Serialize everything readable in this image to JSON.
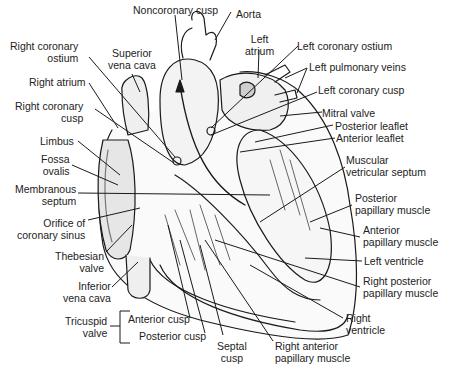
{
  "diagram": {
    "labels_left": [
      {
        "id": "right-coronary-ostium",
        "text": "Right coronary\nostium"
      },
      {
        "id": "superior-vena-cava",
        "text": "Superior\nvena cava"
      },
      {
        "id": "right-atrium",
        "text": "Right atrium"
      },
      {
        "id": "right-coronary-cusp",
        "text": "Right coronary\ncusp"
      },
      {
        "id": "limbus",
        "text": "Limbus"
      },
      {
        "id": "fossa-ovalis",
        "text": "Fossa\novalis"
      },
      {
        "id": "membranous-septum",
        "text": "Membranous\nseptum"
      },
      {
        "id": "orifice-coronary-sinus",
        "text": "Orifice of\ncoronary sinus"
      },
      {
        "id": "thebesian-valve",
        "text": "Thebesian\nvalve"
      },
      {
        "id": "inferior-vena-cava",
        "text": "Inferior\nvena cava"
      }
    ],
    "labels_top": [
      {
        "id": "noncoronary-cusp",
        "text": "Noncoronary cusp"
      },
      {
        "id": "aorta",
        "text": "Aorta"
      },
      {
        "id": "left-atrium",
        "text": "Left\natrium"
      }
    ],
    "labels_right": [
      {
        "id": "left-coronary-ostium",
        "text": "Left coronary ostium"
      },
      {
        "id": "left-pulmonary-veins",
        "text": "Left pulmonary veins"
      },
      {
        "id": "left-coronary-cusp",
        "text": "Left coronary cusp"
      },
      {
        "id": "mitral-valve",
        "text": "Mitral valve"
      },
      {
        "id": "posterior-leaflet",
        "text": "Posterior leaflet"
      },
      {
        "id": "anterior-leaflet",
        "text": "Anterior leaflet"
      },
      {
        "id": "muscular-ventricular-septum",
        "text": "Muscular\nvetricular septum"
      },
      {
        "id": "posterior-papillary-muscle",
        "text": "Posterior\npapillary muscle"
      },
      {
        "id": "anterior-papillary-muscle",
        "text": "Anterior\npapillary muscle"
      },
      {
        "id": "left-ventricle",
        "text": "Left ventricle"
      },
      {
        "id": "right-posterior-papillary-muscle",
        "text": "Right posterior\npapillary muscle"
      },
      {
        "id": "right-ventricle",
        "text": "Right\nventricle"
      }
    ],
    "labels_bottom": [
      {
        "id": "tricuspid-valve",
        "text": "Tricuspid\nvalve"
      },
      {
        "id": "anterior-cusp",
        "text": "Anterior cusp"
      },
      {
        "id": "posterior-cusp",
        "text": "Posterior cusp"
      },
      {
        "id": "septal-cusp",
        "text": "Septal\ncusp"
      },
      {
        "id": "right-anterior-papillary-muscle",
        "text": "Right anterior\npapillary muscle"
      }
    ],
    "colors": {
      "ink": "#1a1a1a",
      "background": "#ffffff",
      "shade": "#8a8a8a"
    }
  }
}
